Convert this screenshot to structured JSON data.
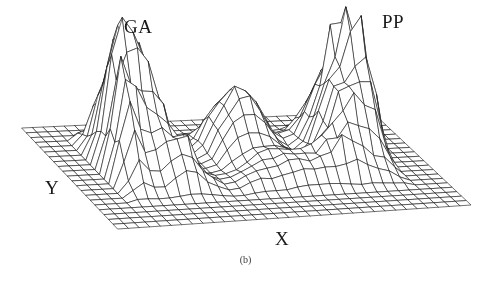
{
  "figure": {
    "caption": "(b)",
    "background_color": "#ffffff",
    "line_color": "#1c1c1c",
    "width": 491,
    "height": 281
  },
  "labels": {
    "peak_left": "GA",
    "peak_right": "PP",
    "axis_y": "Y",
    "axis_x": "X"
  },
  "chart_data": {
    "type": "surface",
    "title": "",
    "subtitle": "",
    "xlabel": "X",
    "ylabel": "Y",
    "zlabel": "",
    "grid": true,
    "legend_position": "none",
    "annotations": [
      {
        "text": "GA",
        "target": "left peak",
        "x": 0.22,
        "y": 0.92
      },
      {
        "text": "PP",
        "target": "right peak",
        "x": 0.8,
        "y": 0.92
      }
    ],
    "projection": {
      "type": "isometric-wireframe",
      "origin_left_px": [
        22,
        128
      ],
      "origin_front_px": [
        118,
        229
      ],
      "origin_right_px": [
        471,
        205
      ],
      "origin_back_px": [
        372,
        112
      ],
      "z_scale_px": 125
    },
    "nx": 34,
    "ny": 22,
    "xlim": [
      0,
      33
    ],
    "ylim": [
      0,
      21
    ],
    "zlim": [
      0,
      1
    ],
    "peaks": [
      {
        "name": "GA",
        "cx": 7.0,
        "cy": 13.5,
        "height": 1.0,
        "sigma_x": 3.0,
        "sigma_y": 4.0,
        "roughness": 0.3
      },
      {
        "name": "PP",
        "cx": 27.0,
        "cy": 13.0,
        "height": 0.98,
        "sigma_x": 3.2,
        "sigma_y": 4.2,
        "roughness": 0.28
      },
      {
        "name": "center",
        "cx": 17.5,
        "cy": 14.0,
        "height": 0.52,
        "sigma_x": 3.4,
        "sigma_y": 3.2,
        "roughness": 0.07
      },
      {
        "name": "GA-shoulder",
        "cx": 4.0,
        "cy": 10.0,
        "height": 0.62,
        "sigma_x": 2.0,
        "sigma_y": 3.0,
        "roughness": 0.32
      },
      {
        "name": "PP-shoulder",
        "cx": 30.0,
        "cy": 11.5,
        "height": 0.58,
        "sigma_x": 1.8,
        "sigma_y": 3.0,
        "roughness": 0.3
      },
      {
        "name": "front-ridge",
        "cx": 20.0,
        "cy": 7.5,
        "height": 0.2,
        "sigma_x": 5.0,
        "sigma_y": 3.0,
        "roughness": 0.04
      },
      {
        "name": "left-spur",
        "cx": 9.5,
        "cy": 8.0,
        "height": 0.26,
        "sigma_x": 2.4,
        "sigma_y": 2.6,
        "roughness": 0.1
      },
      {
        "name": "right-spur",
        "cx": 24.5,
        "cy": 8.5,
        "height": 0.22,
        "sigma_x": 2.4,
        "sigma_y": 2.8,
        "roughness": 0.1
      }
    ],
    "saddles": [
      {
        "name": "GA-center-valley",
        "cx": 12.0,
        "cy": 13.0,
        "depth": 0.18
      },
      {
        "name": "center-PP-valley",
        "cx": 22.5,
        "cy": 13.0,
        "depth": 0.16
      }
    ],
    "flat_margin": {
      "x_low": 3,
      "x_high": 3,
      "y_low": 4,
      "y_high": 2
    }
  }
}
